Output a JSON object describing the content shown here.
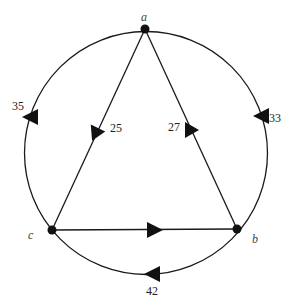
{
  "graph": {
    "title": "",
    "colors": {
      "stroke": "#1a1a1a",
      "background": "#ffffff"
    },
    "nodes": [
      {
        "id": "a",
        "label": "a",
        "x": 145,
        "y": 29
      },
      {
        "id": "b",
        "label": "b",
        "x": 237,
        "y": 229
      },
      {
        "id": "c",
        "label": "c",
        "x": 52,
        "y": 230
      }
    ],
    "edges": [
      {
        "id": "a-c-inner",
        "from": "a",
        "to": "c",
        "weight": "25",
        "type": "straight"
      },
      {
        "id": "b-a-inner",
        "from": "b",
        "to": "a",
        "weight": "27",
        "type": "straight"
      },
      {
        "id": "c-b-inner",
        "from": "c",
        "to": "b",
        "weight": "",
        "type": "straight"
      },
      {
        "id": "a-c-outer",
        "from": "c",
        "to": "a",
        "weight": "35",
        "type": "arc"
      },
      {
        "id": "a-b-outer",
        "from": "a",
        "to": "b",
        "weight": "33",
        "type": "arc"
      },
      {
        "id": "b-c-outer",
        "from": "b",
        "to": "c",
        "weight": "42",
        "type": "arc"
      }
    ]
  },
  "labels": {
    "node_a": "a",
    "node_b": "b",
    "node_c": "c",
    "w_ac_inner": "25",
    "w_ba_inner": "27",
    "w_ca_outer": "35",
    "w_ab_outer": "33",
    "w_bc_outer": "42"
  }
}
